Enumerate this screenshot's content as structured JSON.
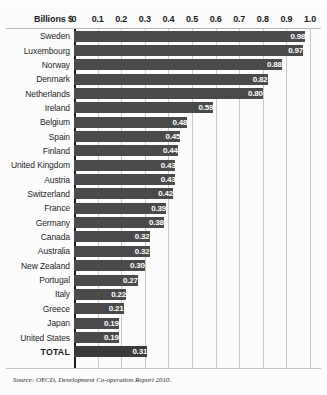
{
  "chart_data": {
    "type": "bar",
    "orientation": "horizontal",
    "title": "",
    "xlabel": "Billions $",
    "ylabel": "",
    "xlim": [
      0,
      1.0
    ],
    "grid": true,
    "legend": null,
    "axis_title": "Billions $",
    "tick_labels": [
      "0",
      "0.1",
      "0.2",
      "0.3",
      "0.4",
      "0.5",
      "0.6",
      "0.7",
      "0.8",
      "0.9",
      "1.0"
    ],
    "tick_values": [
      0,
      0.1,
      0.2,
      0.3,
      0.4,
      0.5,
      0.6,
      0.7,
      0.8,
      0.9,
      1.0
    ],
    "categories": [
      "Sweden",
      "Luxembourg",
      "Norway",
      "Denmark",
      "Netherlands",
      "Ireland",
      "Belgium",
      "Spain",
      "Finland",
      "United Kingdom",
      "Austria",
      "Switzerland",
      "France",
      "Germany",
      "Canada",
      "Australia",
      "New Zealand",
      "Portugal",
      "Italy",
      "Greece",
      "Japan",
      "United States",
      "TOTAL"
    ],
    "values": [
      0.98,
      0.97,
      0.88,
      0.82,
      0.8,
      0.59,
      0.48,
      0.45,
      0.44,
      0.43,
      0.43,
      0.42,
      0.39,
      0.38,
      0.32,
      0.32,
      0.3,
      0.27,
      0.22,
      0.21,
      0.19,
      0.19,
      0.31
    ],
    "value_labels": [
      "0.98",
      "0.97",
      "0.88",
      "0.82",
      "0.80",
      "0.59",
      "0.48",
      "0.45",
      "0.44",
      "0.43",
      "0.43",
      "0.42",
      "0.39",
      "0.38",
      "0.32",
      "0.32",
      "0.30",
      "0.27",
      "0.22",
      "0.21",
      "0.19",
      "0.19",
      "0.31"
    ],
    "total_row_index": 22,
    "bar_color": "#4a4a4a",
    "total_bar_color": "#3a3a3a",
    "gridline_color": "#c9c9c9",
    "axis_color": "#1c1c1c",
    "value_label_color": "#ffffff"
  },
  "source": {
    "lead": "Source:",
    "body": "OECD, Development Co-operation Report 2010",
    "trailing": "."
  }
}
